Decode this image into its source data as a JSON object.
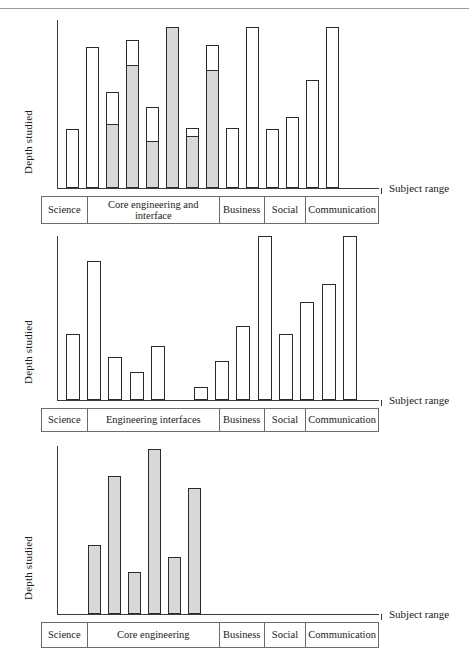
{
  "figure": {
    "axis_labels": {
      "y": "Depth studied",
      "x": "Subject range"
    },
    "legend": {
      "grey_label": "shaded portion",
      "white_label": "open portion"
    },
    "colors": {
      "bar_fill_grey": "#d8d8d8",
      "bar_fill_white": "#ffffff",
      "bar_stroke": "#2b2b2b",
      "axis": "#3b3b3b",
      "box_stroke": "#6b6b6b"
    }
  },
  "chart_data": [
    {
      "id": "chart-1",
      "type": "bar",
      "title": "",
      "xlabel": "Subject range",
      "ylabel": "Depth studied",
      "ylim": [
        0,
        100
      ],
      "grid": false,
      "legend": "none",
      "stacked": true,
      "note": "Stacked bars: grey lower segment plus white upper segment; total = value.",
      "categories": [
        {
          "label": "Science",
          "bars": 2
        },
        {
          "label": "Core engineering and interface",
          "bars": 7
        },
        {
          "label": "Business",
          "bars": 2
        },
        {
          "label": "Social",
          "bars": 2
        },
        {
          "label": "Communication",
          "bars": 3
        }
      ],
      "category_labels": [
        "Science",
        "Core engineering and interface",
        "Business",
        "Social",
        "Communication"
      ],
      "x": [
        1,
        2,
        3,
        4,
        5,
        6,
        7,
        8,
        9,
        10,
        11,
        12,
        13,
        14,
        15,
        16
      ],
      "series": [
        {
          "name": "grey (lower)",
          "values": [
            0,
            0,
            38,
            73,
            28,
            96,
            31,
            70,
            0,
            0,
            0,
            0,
            0,
            0,
            0,
            0
          ]
        },
        {
          "name": "white (upper)",
          "values": [
            35,
            84,
            57,
            88,
            48,
            96,
            36,
            85,
            0,
            0,
            0,
            0,
            0,
            0,
            0,
            0
          ]
        }
      ],
      "values_total": [
        35,
        84,
        57,
        88,
        48,
        96,
        36,
        85,
        36,
        96,
        35,
        42,
        64,
        96,
        0,
        0
      ],
      "values_grey": [
        0,
        0,
        38,
        73,
        28,
        96,
        31,
        70,
        0,
        0,
        0,
        0,
        0,
        0,
        0,
        0
      ]
    },
    {
      "id": "chart-2",
      "type": "bar",
      "title": "",
      "xlabel": "Subject range",
      "ylabel": "Depth studied",
      "ylim": [
        0,
        100
      ],
      "grid": false,
      "legend": "none",
      "stacked": false,
      "note": "All bars unfilled (white). One position in Engineering interfaces has no bar.",
      "categories": [
        {
          "label": "Science",
          "bars": 2
        },
        {
          "label": "Engineering interfaces",
          "bars": 6
        },
        {
          "label": "Business",
          "bars": 2
        },
        {
          "label": "Social",
          "bars": 2
        },
        {
          "label": "Communication",
          "bars": 3
        }
      ],
      "category_labels": [
        "Science",
        "Engineering interfaces",
        "Business",
        "Social",
        "Communication"
      ],
      "values": [
        40,
        85,
        26,
        17,
        33,
        0,
        8,
        24,
        45,
        100,
        40,
        60,
        71,
        100,
        0
      ],
      "values_grey": [
        0,
        0,
        0,
        0,
        0,
        0,
        0,
        0,
        0,
        0,
        0,
        0,
        0,
        0,
        0
      ]
    },
    {
      "id": "chart-3",
      "type": "bar",
      "title": "",
      "xlabel": "Subject range",
      "ylabel": "Depth studied",
      "ylim": [
        0,
        100
      ],
      "grid": false,
      "legend": "none",
      "stacked": false,
      "note": "All bars solid grey, only in Core engineering; other categories empty.",
      "categories": [
        {
          "label": "Science",
          "bars": 0
        },
        {
          "label": "Core engineering",
          "bars": 6
        },
        {
          "label": "Business",
          "bars": 0
        },
        {
          "label": "Social",
          "bars": 0
        },
        {
          "label": "Communication",
          "bars": 0
        }
      ],
      "category_labels": [
        "Science",
        "Core engineering",
        "Business",
        "Social",
        "Communication"
      ],
      "values": [
        41,
        82,
        25,
        98,
        34,
        75
      ],
      "values_grey": [
        41,
        82,
        25,
        98,
        34,
        75
      ]
    }
  ]
}
